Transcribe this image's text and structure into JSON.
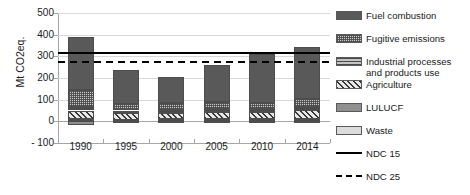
{
  "chart_data": {
    "type": "bar",
    "subtype": "stacked-bar-with-threshold-lines",
    "title": "",
    "xlabel": "",
    "ylabel": "Mt CO2eq.",
    "ylim": [
      -100,
      500
    ],
    "yticks": [
      500,
      400,
      300,
      200,
      100,
      0,
      "- 100"
    ],
    "ytick_values": [
      500,
      400,
      300,
      200,
      100,
      0,
      -100
    ],
    "grid": true,
    "legend_position": "right",
    "categories": [
      "1990",
      "1995",
      "2000",
      "2005",
      "2010",
      "2014"
    ],
    "series": [
      {
        "name": "Fuel combustion",
        "pattern": "solid-dark-gray",
        "color": "#595959",
        "values": [
          247,
          158,
          122,
          171,
          227,
          241
        ]
      },
      {
        "name": "Fugitive emissions",
        "pattern": "fine-checker",
        "color": "#c9c9c9",
        "values": [
          75,
          29,
          31,
          29,
          29,
          34
        ]
      },
      {
        "name": "Industrial processes and products use",
        "pattern": "horizontal-lines",
        "color": "#c4c4c4",
        "values": [
          18,
          10,
          16,
          14,
          14,
          15
        ]
      },
      {
        "name": "Agriculture",
        "pattern": "diagonal-hatch",
        "color": "#e8e8e8",
        "values": [
          40,
          33,
          28,
          34,
          33,
          40
        ]
      },
      {
        "name": "LULUCF",
        "pattern": "solid-medium-gray",
        "color": "#8f8f8f",
        "values": [
          -18,
          -3,
          -2,
          -2,
          -2,
          -2
        ]
      },
      {
        "name": "Waste",
        "pattern": "solid-light-gray",
        "color": "#dcdcdc",
        "values": [
          10,
          7,
          9,
          10,
          10,
          12
        ]
      }
    ],
    "stack_order_bottom_to_top": [
      "Waste",
      "Agriculture",
      "Industrial processes and products use",
      "Fugitive emissions",
      "Fuel combustion"
    ],
    "totals": [
      390,
      237,
      206,
      258,
      313,
      342
    ],
    "threshold_lines": [
      {
        "name": "NDC 15",
        "style": "solid",
        "color": "#000000",
        "value": 318
      },
      {
        "name": "NDC 25",
        "style": "dashed",
        "color": "#000000",
        "value": 280
      }
    ]
  },
  "axis": {
    "y_title": "Mt CO2eq.",
    "y_ticks": [
      "500",
      "400",
      "300",
      "200",
      "100",
      "0",
      "- 100"
    ],
    "x_ticks": [
      "1990",
      "1995",
      "2000",
      "2005",
      "2010",
      "2014"
    ]
  },
  "legend": {
    "items": [
      {
        "label": "Fuel combustion",
        "kind": "swatch",
        "swatch": "p-fuel"
      },
      {
        "label": "Fugitive emissions",
        "kind": "swatch",
        "swatch": "p-fugitive"
      },
      {
        "label": "Industrial processes\nand products use",
        "kind": "swatch",
        "swatch": "p-industrial"
      },
      {
        "label": "Agriculture",
        "kind": "swatch",
        "swatch": "p-agriculture"
      },
      {
        "label": "LULUCF",
        "kind": "swatch",
        "swatch": "p-lulucf"
      },
      {
        "label": "Waste",
        "kind": "swatch",
        "swatch": "p-waste"
      },
      {
        "label": "NDC 15",
        "kind": "line",
        "swatch": "solid"
      },
      {
        "label": "NDC 25",
        "kind": "line",
        "swatch": "dashed"
      }
    ]
  }
}
